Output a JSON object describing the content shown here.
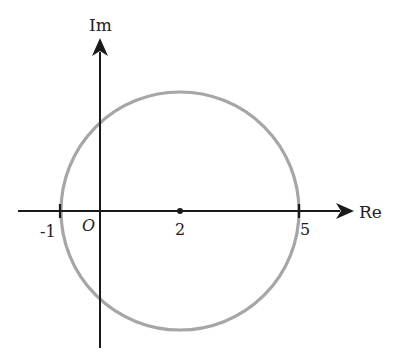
{
  "diagram": {
    "type": "complex-plane-circle",
    "axes": {
      "real_label": "Re",
      "imag_label": "Im",
      "origin_label": "O"
    },
    "ticks": {
      "neg_one": "-1",
      "center": "2",
      "five": "5"
    },
    "circle": {
      "center_re": 2,
      "center_im": 0,
      "radius": 3
    },
    "colors": {
      "axis": "#1a1a1a",
      "circle": "#a6a6a6",
      "text": "#222222"
    }
  }
}
